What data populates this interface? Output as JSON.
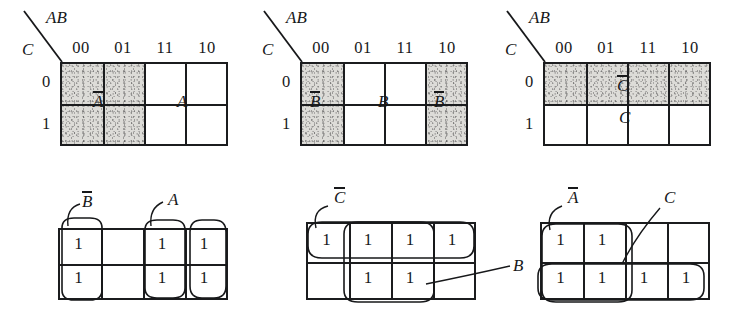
{
  "figure": {
    "rows": 2,
    "columns": 3,
    "variables": [
      "A",
      "B",
      "C"
    ],
    "column_header_label": "AB",
    "row_header_label": "C",
    "column_headers": [
      "00",
      "01",
      "11",
      "10"
    ],
    "row_headers": [
      "0",
      "1"
    ]
  },
  "maps": [
    {
      "id": "map-top-left",
      "position": "top-left",
      "kind": "variable-region-shading",
      "shaded_cells": [
        [
          0,
          0
        ],
        [
          0,
          1
        ],
        [
          1,
          0
        ],
        [
          1,
          1
        ]
      ],
      "region_labels": [
        {
          "text": "A",
          "overbar": true,
          "name": "label-a-not"
        },
        {
          "text": "A",
          "overbar": false,
          "name": "label-a"
        }
      ]
    },
    {
      "id": "map-top-middle",
      "position": "top-middle",
      "kind": "variable-region-shading",
      "shaded_cells": [
        [
          0,
          0
        ],
        [
          1,
          0
        ],
        [
          0,
          3
        ],
        [
          1,
          3
        ]
      ],
      "region_labels": [
        {
          "text": "B",
          "overbar": true,
          "name": "label-b-not-left"
        },
        {
          "text": "B",
          "overbar": false,
          "name": "label-b"
        },
        {
          "text": "B",
          "overbar": true,
          "name": "label-b-not-right"
        }
      ]
    },
    {
      "id": "map-top-right",
      "position": "top-right",
      "kind": "variable-region-shading",
      "shaded_cells": [
        [
          0,
          0
        ],
        [
          0,
          1
        ],
        [
          0,
          2
        ],
        [
          0,
          3
        ]
      ],
      "region_labels": [
        {
          "text": "C",
          "overbar": true,
          "name": "label-c-not"
        },
        {
          "text": "C",
          "overbar": false,
          "name": "label-c"
        }
      ]
    },
    {
      "id": "map-bottom-left",
      "position": "bottom-left",
      "kind": "grouped-ones",
      "cell_values": [
        [
          "1",
          "",
          "1",
          "1"
        ],
        [
          "1",
          "",
          "1",
          "1"
        ]
      ],
      "groups": [
        {
          "name": "group-b-not",
          "label": "B",
          "overbar": true,
          "cells": [
            [
              0,
              0
            ],
            [
              1,
              0
            ]
          ]
        },
        {
          "name": "group-a",
          "label": "A",
          "overbar": false,
          "cells": [
            [
              0,
              2
            ],
            [
              1,
              2
            ]
          ]
        },
        {
          "name": "group-a-wrap",
          "label": "",
          "overbar": false,
          "cells": [
            [
              0,
              3
            ],
            [
              1,
              3
            ]
          ]
        }
      ]
    },
    {
      "id": "map-bottom-middle",
      "position": "bottom-middle",
      "kind": "grouped-ones",
      "cell_values": [
        [
          "1",
          "1",
          "1",
          "1"
        ],
        [
          "",
          "1",
          "1",
          ""
        ]
      ],
      "groups": [
        {
          "name": "group-c-not",
          "label": "C",
          "overbar": true,
          "cells": [
            [
              0,
              0
            ],
            [
              0,
              1
            ],
            [
              0,
              2
            ],
            [
              0,
              3
            ]
          ]
        },
        {
          "name": "group-b",
          "label": "B",
          "overbar": false,
          "cells": [
            [
              0,
              1
            ],
            [
              0,
              2
            ],
            [
              1,
              1
            ],
            [
              1,
              2
            ]
          ]
        }
      ]
    },
    {
      "id": "map-bottom-right",
      "position": "bottom-right",
      "kind": "grouped-ones",
      "cell_values": [
        [
          "1",
          "1",
          "",
          ""
        ],
        [
          "1",
          "1",
          "1",
          "1"
        ]
      ],
      "groups": [
        {
          "name": "group-a-not",
          "label": "A",
          "overbar": true,
          "cells": [
            [
              0,
              0
            ],
            [
              0,
              1
            ],
            [
              1,
              0
            ],
            [
              1,
              1
            ]
          ]
        },
        {
          "name": "group-c",
          "label": "C",
          "overbar": false,
          "cells": [
            [
              1,
              0
            ],
            [
              1,
              1
            ],
            [
              1,
              2
            ],
            [
              1,
              3
            ]
          ]
        }
      ]
    }
  ],
  "colors": {
    "ink": "#17181a",
    "rule": "#1b1c1e",
    "shading": "#d8d6d2",
    "paper": "#ffffff"
  }
}
